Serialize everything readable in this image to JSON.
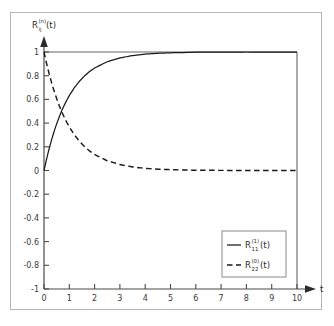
{
  "figure": {
    "background_color": "#ffffff",
    "frame_color": "#b6b6b6",
    "curve_color": "#1a1a1a",
    "axis_color": "#4a4a4a"
  },
  "chart_data": {
    "type": "line",
    "title": "",
    "xlabel": "t",
    "ylabel": "R_ij^(n)(t)",
    "ylabel_parts": {
      "base": "R",
      "sub": "ij",
      "sup": "(n)",
      "arg": "(t)"
    },
    "xlim": [
      0,
      10
    ],
    "ylim": [
      -1,
      1
    ],
    "grid": false,
    "xticks": [
      0,
      1,
      2,
      3,
      4,
      5,
      6,
      7,
      8,
      9,
      10
    ],
    "xtick_labels": [
      "0",
      "1",
      "2",
      "3",
      "4",
      "5",
      "6",
      "7",
      "8",
      "9",
      "10"
    ],
    "yticks": [
      -1,
      -0.8,
      -0.6,
      -0.4,
      -0.2,
      0,
      0.2,
      0.4,
      0.6,
      0.8,
      1
    ],
    "ytick_labels": [
      "-1",
      "-0.8",
      "-0.6",
      "-0.4",
      "-0.2",
      "0",
      "0.2",
      "0.4",
      "0.6",
      "0.8",
      "1"
    ],
    "legend_position": "lower right",
    "series": [
      {
        "name": "R_11^(1)(t)",
        "name_parts": {
          "base": "R",
          "sub": "11",
          "sup": "(1)",
          "arg": "(t)"
        },
        "style": "solid",
        "color": "#1a1a1a",
        "x": [
          0,
          0.1,
          0.2,
          0.3,
          0.4,
          0.5,
          0.6,
          0.69,
          0.8,
          0.9,
          1.0,
          1.2,
          1.4,
          1.6,
          1.8,
          2.0,
          2.5,
          3.0,
          3.5,
          4.0,
          4.5,
          5.0,
          6.0,
          7.0,
          8.0,
          9.0,
          10.0
        ],
        "y": [
          0,
          0.095,
          0.181,
          0.259,
          0.33,
          0.393,
          0.451,
          0.499,
          0.551,
          0.593,
          0.632,
          0.699,
          0.753,
          0.798,
          0.835,
          0.865,
          0.918,
          0.95,
          0.97,
          0.982,
          0.989,
          0.993,
          0.998,
          0.999,
          1.0,
          1.0,
          1.0
        ]
      },
      {
        "name": "R_22^(0)(t)",
        "name_parts": {
          "base": "R",
          "sub": "22",
          "sup": "(0)",
          "arg": "(t)"
        },
        "style": "dashed",
        "color": "#1a1a1a",
        "x": [
          0,
          0.1,
          0.2,
          0.3,
          0.4,
          0.5,
          0.6,
          0.69,
          0.8,
          0.9,
          1.0,
          1.2,
          1.4,
          1.6,
          1.8,
          2.0,
          2.5,
          3.0,
          3.5,
          4.0,
          4.5,
          5.0,
          6.0,
          7.0,
          8.0,
          9.0,
          10.0
        ],
        "y": [
          1.0,
          0.905,
          0.819,
          0.741,
          0.67,
          0.607,
          0.549,
          0.501,
          0.449,
          0.407,
          0.368,
          0.301,
          0.247,
          0.202,
          0.165,
          0.135,
          0.082,
          0.05,
          0.03,
          0.018,
          0.011,
          0.007,
          0.002,
          0.001,
          0.0,
          0.0,
          0.0
        ]
      }
    ],
    "reference_lines": [
      {
        "name": "upper-bound",
        "orientation": "horizontal",
        "value": 1,
        "color": "#9a9a9a"
      },
      {
        "name": "right-boundary",
        "orientation": "vertical",
        "value": 10,
        "color": "#6a6a6a"
      }
    ],
    "annotations": {
      "crossing_point": {
        "x": 0.69,
        "y": 0.5
      }
    }
  }
}
